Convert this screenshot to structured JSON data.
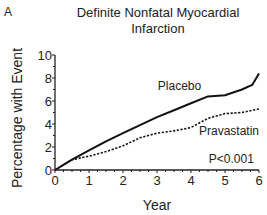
{
  "panel_label": "A",
  "chart_data": {
    "type": "line",
    "title": "Definite Nonfatal Myocardial Infarction",
    "title_lines": [
      "Definite Nonfatal Myocardial",
      "Infarction"
    ],
    "xlabel": "Year",
    "ylabel": "Percentage with Event",
    "xlim": [
      0,
      6
    ],
    "ylim": [
      0,
      10
    ],
    "x_ticks": [
      0,
      1,
      2,
      3,
      4,
      5,
      6
    ],
    "y_ticks": [
      0,
      2,
      4,
      6,
      8,
      10
    ],
    "grid": false,
    "series": [
      {
        "name": "Placebo",
        "style": "solid",
        "x": [
          0,
          0.5,
          1,
          1.5,
          2,
          2.5,
          3,
          3.5,
          4,
          4.5,
          5,
          5.5,
          5.8,
          6
        ],
        "y": [
          0,
          0.9,
          1.7,
          2.5,
          3.2,
          3.9,
          4.6,
          5.2,
          5.8,
          6.4,
          6.5,
          7.0,
          7.4,
          8.4
        ]
      },
      {
        "name": "Pravastatin",
        "style": "dashed",
        "x": [
          0,
          0.5,
          1,
          1.5,
          2,
          2.5,
          3,
          3.5,
          4,
          4.5,
          5,
          5.5,
          6
        ],
        "y": [
          0,
          0.9,
          1.2,
          1.6,
          2.1,
          2.8,
          3.2,
          3.4,
          3.7,
          4.5,
          4.9,
          5.0,
          5.3
        ]
      }
    ],
    "annotations": [
      "P<0.001"
    ]
  }
}
